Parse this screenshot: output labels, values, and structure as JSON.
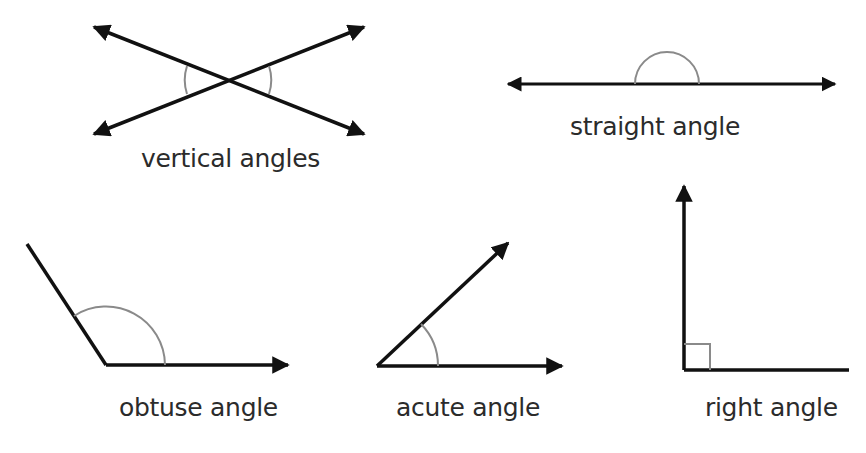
{
  "diagram": {
    "type": "angle types",
    "colors": {
      "line": "#111111",
      "arc": "#8a8a8a",
      "text": "#2b2b2b",
      "background": "#ffffff"
    },
    "figures": [
      {
        "id": "vertical",
        "label": "vertical angles"
      },
      {
        "id": "straight",
        "label": "straight angle"
      },
      {
        "id": "obtuse",
        "label": "obtuse angle"
      },
      {
        "id": "acute",
        "label": "acute angle"
      },
      {
        "id": "right",
        "label": "right angle"
      }
    ]
  }
}
